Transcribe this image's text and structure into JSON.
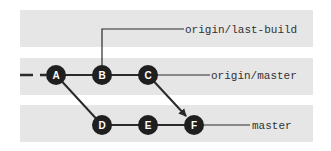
{
  "diagram": {
    "type": "git-commit-graph",
    "colors": {
      "band": "#e6e6e6",
      "node": "#1f1f1f",
      "line": "#2a2a2a",
      "node_text": "#ffffff",
      "label_text": "#333333"
    },
    "lanes": [
      {
        "name": "origin/last-build",
        "label": "origin/last-build"
      },
      {
        "name": "origin/master",
        "label": "origin/master"
      },
      {
        "name": "master",
        "label": "master"
      }
    ],
    "commits": [
      {
        "id": "A",
        "label": "A",
        "lane": "origin/master"
      },
      {
        "id": "B",
        "label": "B",
        "lane": "origin/master"
      },
      {
        "id": "C",
        "label": "C",
        "lane": "origin/master"
      },
      {
        "id": "D",
        "label": "D",
        "lane": "master"
      },
      {
        "id": "E",
        "label": "E",
        "lane": "master"
      },
      {
        "id": "F",
        "label": "F",
        "lane": "master"
      }
    ],
    "edges": [
      {
        "from": "A",
        "to": "B"
      },
      {
        "from": "B",
        "to": "C"
      },
      {
        "from": "A",
        "to": "D"
      },
      {
        "from": "D",
        "to": "E"
      },
      {
        "from": "E",
        "to": "F"
      },
      {
        "from": "C",
        "to": "F",
        "arrow": true
      }
    ],
    "refs": [
      {
        "name": "origin/last-build",
        "points_to": "B"
      },
      {
        "name": "origin/master",
        "points_to": "C"
      },
      {
        "name": "master",
        "points_to": "F"
      }
    ]
  }
}
